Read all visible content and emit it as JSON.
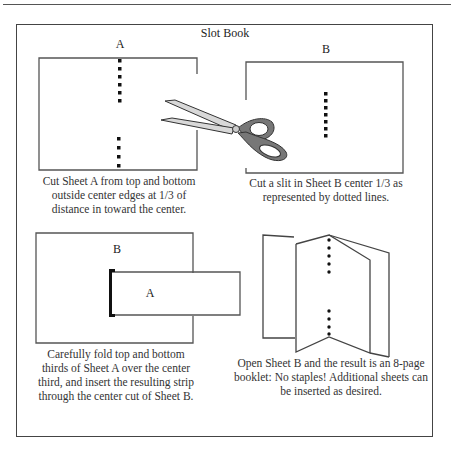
{
  "title": "Slot Book",
  "panels": {
    "step1": {
      "sheet_label": "A",
      "caption_lines": [
        "Cut Sheet A from top and bottom",
        "outside center edges at 1/3 of",
        "distance in toward the center."
      ]
    },
    "step2": {
      "sheet_label": "B",
      "caption_lines": [
        "Cut a slit in Sheet B center 1/3 as",
        "represented by dotted lines."
      ]
    },
    "step3": {
      "outer_label": "B",
      "inner_label": "A",
      "caption_lines": [
        "Carefully fold top and bottom",
        "thirds of Sheet A over the center",
        "third, and insert the resulting strip",
        "through the center cut of Sheet B."
      ]
    },
    "step4": {
      "caption_lines": [
        "Open Sheet B and the result is an 8-page",
        "booklet: No staples! Additional sheets can",
        "be inserted as desired."
      ]
    }
  },
  "icons": {
    "scissors": "scissors-icon"
  },
  "colors": {
    "line": "#444444",
    "dots": "#111111",
    "scissors_fill": "#d8d8d8",
    "scissors_handle": "#777777"
  }
}
